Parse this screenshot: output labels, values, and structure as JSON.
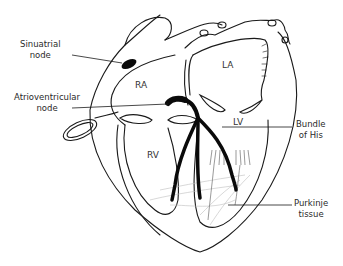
{
  "diagram": {
    "labels": {
      "sinuatrial_line1": "Sinuatrial",
      "sinuatrial_line2": "node",
      "av_line1": "Atrioventricular",
      "av_line2": "node",
      "bundle_line1": "Bundle",
      "bundle_line2": "of His",
      "purkinje_line1": "Purkinje",
      "purkinje_line2": "tissue"
    },
    "chambers": {
      "ra": "RA",
      "la": "LA",
      "lv": "LV",
      "rv": "RV"
    },
    "colors": {
      "line": "#1a1a1a",
      "conduction": "#0a0a0a",
      "purkinje": "#bdbdbd",
      "text": "#2a2a2a"
    }
  }
}
